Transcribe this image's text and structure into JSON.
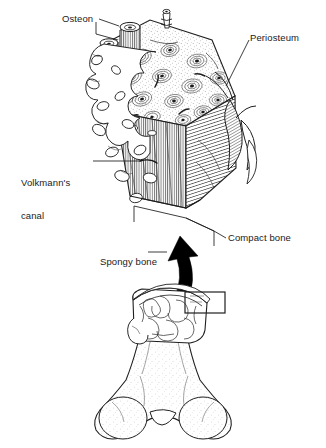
{
  "figure": {
    "background_color": "#ffffff",
    "ink_color": "#1a1a1a",
    "arrow_color": "#000000"
  },
  "labels": {
    "osteon": "Osteon",
    "periosteum": "Periosteum",
    "volkmann_line1": "Volkmann's",
    "volkmann_line2": "canal",
    "compact_bone": "Compact bone",
    "spongy_bone": "Spongy bone"
  },
  "icons": {
    "magnify_arrow": "thick-curved-arrow-icon",
    "callout_box": "callout-rectangle-icon"
  },
  "parts": {
    "magnified_block": "compact-and-spongy-bone-block",
    "whole_bone": "femur-long-bone",
    "cut_section": "epiphysis-cutaway-spongy-bone"
  }
}
